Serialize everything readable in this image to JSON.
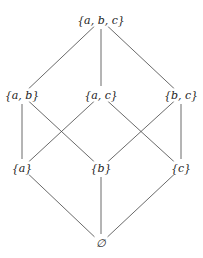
{
  "diagram": {
    "type": "hasse",
    "nodes": [
      {
        "id": "abc",
        "label": "{a, b, c}",
        "x": 101,
        "y": 20
      },
      {
        "id": "ab",
        "label": "{a, b}",
        "x": 22,
        "y": 95
      },
      {
        "id": "ac",
        "label": "{a, c}",
        "x": 101,
        "y": 95
      },
      {
        "id": "bc",
        "label": "{b, c}",
        "x": 181,
        "y": 95
      },
      {
        "id": "a",
        "label": "{a}",
        "x": 22,
        "y": 168
      },
      {
        "id": "b",
        "label": "{b}",
        "x": 101,
        "y": 168
      },
      {
        "id": "c",
        "label": "{c}",
        "x": 181,
        "y": 168
      },
      {
        "id": "empty",
        "label": "∅",
        "x": 101,
        "y": 243
      }
    ],
    "edges": [
      [
        "abc",
        "ab"
      ],
      [
        "abc",
        "ac"
      ],
      [
        "abc",
        "bc"
      ],
      [
        "ab",
        "a"
      ],
      [
        "ab",
        "b"
      ],
      [
        "ac",
        "a"
      ],
      [
        "ac",
        "c"
      ],
      [
        "bc",
        "b"
      ],
      [
        "bc",
        "c"
      ],
      [
        "a",
        "empty"
      ],
      [
        "b",
        "empty"
      ],
      [
        "c",
        "empty"
      ]
    ],
    "edge_color": "#444444"
  }
}
